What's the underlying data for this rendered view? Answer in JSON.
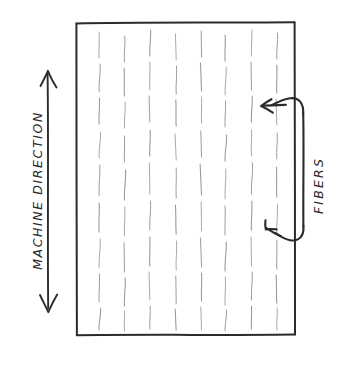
{
  "diagram": {
    "style": "hand-drawn pencil sketch",
    "background_color": "#ffffff",
    "ink_color": "#2b2b2b",
    "fiber_color": "#9a9a9a"
  },
  "labels": {
    "machine_direction": "MACHINE DIRECTION",
    "fibers": "FIBERS"
  },
  "sheet": {
    "name": "material-sheet",
    "x": 76,
    "y": 22,
    "width": 219,
    "height": 313,
    "border_color": "#2b2b2b"
  },
  "machine_direction_arrow": {
    "orientation": "vertical",
    "double_headed": true,
    "x": 48,
    "y_top": 72,
    "y_bottom": 310
  },
  "fibers_bracket": {
    "stem_x": 303,
    "y_top": 112,
    "y_bottom": 228,
    "arrow_count": 2,
    "arrow_direction": "left"
  },
  "fiber_field": {
    "description": "short vertical dashes representing fibers aligned with the machine direction",
    "column_count": 8,
    "columns": [
      {
        "x": 100,
        "dashes": [
          [
            32,
            58
          ],
          [
            64,
            92
          ],
          [
            98,
            124
          ],
          [
            132,
            158
          ],
          [
            165,
            196
          ],
          [
            203,
            232
          ],
          [
            239,
            268
          ],
          [
            274,
            302
          ],
          [
            308,
            330
          ]
        ]
      },
      {
        "x": 125,
        "dashes": [
          [
            36,
            62
          ],
          [
            68,
            96
          ],
          [
            102,
            128
          ],
          [
            136,
            162
          ],
          [
            170,
            200
          ],
          [
            207,
            236
          ],
          [
            243,
            272
          ],
          [
            278,
            306
          ],
          [
            311,
            331
          ]
        ]
      },
      {
        "x": 150,
        "dashes": [
          [
            30,
            56
          ],
          [
            62,
            90
          ],
          [
            96,
            122
          ],
          [
            130,
            156
          ],
          [
            163,
            194
          ],
          [
            201,
            230
          ],
          [
            237,
            266
          ],
          [
            272,
            300
          ],
          [
            306,
            329
          ]
        ]
      },
      {
        "x": 176,
        "dashes": [
          [
            34,
            60
          ],
          [
            66,
            94
          ],
          [
            100,
            126
          ],
          [
            134,
            160
          ],
          [
            168,
            198
          ],
          [
            205,
            234
          ],
          [
            241,
            270
          ],
          [
            276,
            304
          ],
          [
            309,
            330
          ]
        ]
      },
      {
        "x": 201,
        "dashes": [
          [
            31,
            57
          ],
          [
            63,
            91
          ],
          [
            97,
            123
          ],
          [
            131,
            157
          ],
          [
            164,
            195
          ],
          [
            202,
            231
          ],
          [
            238,
            267
          ],
          [
            273,
            301
          ],
          [
            307,
            330
          ]
        ]
      },
      {
        "x": 226,
        "dashes": [
          [
            35,
            61
          ],
          [
            67,
            95
          ],
          [
            101,
            127
          ],
          [
            135,
            161
          ],
          [
            169,
            199
          ],
          [
            206,
            235
          ],
          [
            242,
            271
          ],
          [
            277,
            305
          ],
          [
            310,
            331
          ]
        ]
      },
      {
        "x": 252,
        "dashes": [
          [
            30,
            56
          ],
          [
            62,
            90
          ],
          [
            96,
            122
          ],
          [
            130,
            156
          ],
          [
            163,
            194
          ],
          [
            201,
            230
          ],
          [
            237,
            266
          ],
          [
            272,
            300
          ],
          [
            306,
            329
          ]
        ]
      },
      {
        "x": 277,
        "dashes": [
          [
            33,
            59
          ],
          [
            65,
            93
          ],
          [
            99,
            125
          ],
          [
            133,
            159
          ],
          [
            167,
            197
          ],
          [
            204,
            233
          ],
          [
            240,
            269
          ],
          [
            275,
            303
          ],
          [
            308,
            330
          ]
        ]
      }
    ]
  }
}
